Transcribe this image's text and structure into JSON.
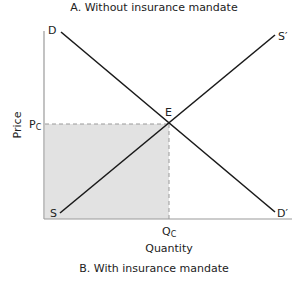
{
  "titles": {
    "top": "A. Without insurance mandate",
    "bottom": "B. With insurance mandate"
  },
  "axes": {
    "x_label": "Quantity",
    "y_label": "Price",
    "x_tick": "Q",
    "x_tick_sub": "C",
    "y_tick": "P",
    "y_tick_sub": "C"
  },
  "curves": {
    "demand_start": "D",
    "demand_end": "D′",
    "supply_start": "S",
    "supply_end": "S′",
    "equilibrium": "E"
  },
  "colors": {
    "line": "#1a1a1a",
    "axis": "#9a9a9a",
    "shade": "#e2e2e2",
    "dash": "#9a9a9a"
  }
}
